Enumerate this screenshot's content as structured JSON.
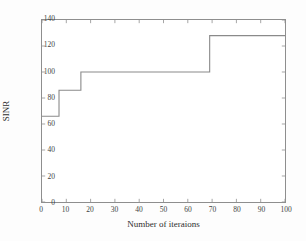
{
  "chart_data": {
    "type": "line",
    "title": "",
    "xlabel": "Number of iteraions",
    "ylabel": "SINR",
    "xlim": [
      0,
      100
    ],
    "ylim": [
      0,
      140
    ],
    "xticks": [
      0,
      10,
      20,
      30,
      40,
      50,
      60,
      70,
      80,
      90,
      100
    ],
    "yticks": [
      0,
      20,
      40,
      60,
      80,
      100,
      120,
      140
    ],
    "grid": false,
    "legend": null,
    "line_style": "step-post",
    "series": [
      {
        "name": "SINR vs iterations",
        "color": "#8a8a8a",
        "x": [
          0,
          7,
          7,
          16,
          16,
          69,
          69,
          100
        ],
        "values": [
          66,
          66,
          86,
          86,
          100,
          100,
          128,
          128
        ]
      }
    ],
    "steps": [
      {
        "start_iteration": 0,
        "end_iteration": 7,
        "sinr": 66
      },
      {
        "start_iteration": 7,
        "end_iteration": 16,
        "sinr": 86
      },
      {
        "start_iteration": 16,
        "end_iteration": 69,
        "sinr": 100
      },
      {
        "start_iteration": 69,
        "end_iteration": 100,
        "sinr": 128
      }
    ]
  },
  "axes": {
    "x_tick_labels": [
      "0",
      "10",
      "20",
      "30",
      "40",
      "50",
      "60",
      "70",
      "80",
      "90",
      "100"
    ],
    "y_tick_labels": [
      "0",
      "20",
      "40",
      "60",
      "80",
      "100",
      "120",
      "140"
    ],
    "x_title": "Number of iteraions",
    "y_title": "SINR"
  },
  "style": {
    "axis_color": "#8e8e8e",
    "line_color": "#8a8a8a",
    "text_color": "#3f3f3f",
    "background": "#ffffff"
  }
}
